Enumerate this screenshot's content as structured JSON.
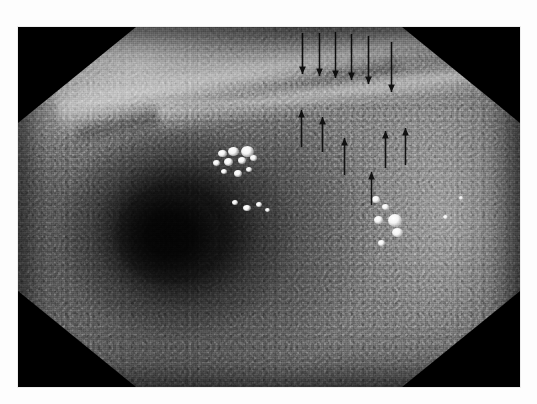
{
  "page": {
    "background_color": "#fdfdfd",
    "width": 537,
    "height": 404
  },
  "figure": {
    "kind": "endoscopic-photograph",
    "modality": "white-light endoscopy",
    "color_mode": "grayscale",
    "frame": {
      "x": 18,
      "y": 27,
      "width": 502,
      "height": 360
    },
    "field_of_view_shape": "octagonal",
    "corner_mask_color": "#000000",
    "caption_visible": false
  },
  "anatomy": {
    "lumen": {
      "center_x": 170,
      "center_y": 235,
      "radius": 50,
      "label": "lumen"
    },
    "fold": {
      "label": "mucosal fold / ridge",
      "orientation": "lower-left to upper-right"
    },
    "bright_rim": {
      "label": "illuminated proximal wall",
      "location": "upper-left"
    }
  },
  "highlights": [
    {
      "name": "mucus-highlight-1",
      "x": 218,
      "y": 150,
      "w": 9,
      "h": 7
    },
    {
      "name": "mucus-highlight-2",
      "x": 228,
      "y": 147,
      "w": 11,
      "h": 9
    },
    {
      "name": "mucus-highlight-3",
      "x": 241,
      "y": 146,
      "w": 13,
      "h": 11
    },
    {
      "name": "mucus-highlight-4",
      "x": 213,
      "y": 160,
      "w": 7,
      "h": 6
    },
    {
      "name": "mucus-highlight-5",
      "x": 224,
      "y": 158,
      "w": 9,
      "h": 8
    },
    {
      "name": "mucus-highlight-6",
      "x": 238,
      "y": 157,
      "w": 8,
      "h": 7
    },
    {
      "name": "mucus-highlight-7",
      "x": 250,
      "y": 155,
      "w": 7,
      "h": 6
    },
    {
      "name": "mucus-highlight-8",
      "x": 221,
      "y": 169,
      "w": 6,
      "h": 5
    },
    {
      "name": "mucus-highlight-9",
      "x": 234,
      "y": 170,
      "w": 8,
      "h": 7
    },
    {
      "name": "mucus-highlight-10",
      "x": 246,
      "y": 167,
      "w": 6,
      "h": 5
    },
    {
      "name": "mucus-highlight-11",
      "x": 232,
      "y": 200,
      "w": 6,
      "h": 5
    },
    {
      "name": "mucus-highlight-12",
      "x": 243,
      "y": 205,
      "w": 8,
      "h": 6
    },
    {
      "name": "mucus-highlight-13",
      "x": 256,
      "y": 202,
      "w": 6,
      "h": 5
    },
    {
      "name": "mucus-highlight-14",
      "x": 265,
      "y": 208,
      "w": 5,
      "h": 4
    },
    {
      "name": "mucus-highlight-15",
      "x": 372,
      "y": 196,
      "w": 8,
      "h": 7
    },
    {
      "name": "mucus-highlight-16",
      "x": 382,
      "y": 204,
      "w": 7,
      "h": 6
    },
    {
      "name": "mucus-highlight-17",
      "x": 374,
      "y": 216,
      "w": 9,
      "h": 8
    },
    {
      "name": "mucus-highlight-18",
      "x": 388,
      "y": 214,
      "w": 14,
      "h": 13
    },
    {
      "name": "mucus-highlight-19",
      "x": 392,
      "y": 228,
      "w": 11,
      "h": 9
    },
    {
      "name": "mucus-highlight-20",
      "x": 378,
      "y": 240,
      "w": 7,
      "h": 6
    },
    {
      "name": "mucus-highlight-21",
      "x": 443,
      "y": 215,
      "w": 5,
      "h": 4
    },
    {
      "name": "mucus-highlight-22",
      "x": 459,
      "y": 196,
      "w": 4,
      "h": 4
    }
  ],
  "annotations": {
    "label": "arrow markers delineating the lesion border",
    "arrow_color": "#111111",
    "count": 12,
    "arrows": [
      {
        "name": "arrow-down-1",
        "direction": "down",
        "x": 302,
        "y_start": 33,
        "y_end": 74
      },
      {
        "name": "arrow-down-2",
        "direction": "down",
        "x": 319,
        "y_start": 33,
        "y_end": 76
      },
      {
        "name": "arrow-down-3",
        "direction": "down",
        "x": 335,
        "y_start": 32,
        "y_end": 78
      },
      {
        "name": "arrow-down-4",
        "direction": "down",
        "x": 351,
        "y_start": 34,
        "y_end": 80
      },
      {
        "name": "arrow-down-5",
        "direction": "down",
        "x": 368,
        "y_start": 36,
        "y_end": 84
      },
      {
        "name": "arrow-down-6",
        "direction": "down",
        "x": 391,
        "y_start": 42,
        "y_end": 92
      },
      {
        "name": "arrow-up-1",
        "direction": "up",
        "x": 301,
        "y_start": 147,
        "y_end": 110
      },
      {
        "name": "arrow-up-2",
        "direction": "up",
        "x": 322,
        "y_start": 152,
        "y_end": 117
      },
      {
        "name": "arrow-up-3",
        "direction": "up",
        "x": 344,
        "y_start": 175,
        "y_end": 138
      },
      {
        "name": "arrow-up-4",
        "direction": "up",
        "x": 371,
        "y_start": 205,
        "y_end": 172
      },
      {
        "name": "arrow-up-5",
        "direction": "up",
        "x": 385,
        "y_start": 168,
        "y_end": 131
      },
      {
        "name": "arrow-up-6",
        "direction": "up",
        "x": 405,
        "y_start": 165,
        "y_end": 128
      }
    ]
  },
  "ghost_text": {
    "top": "",
    "bottom": "·  ·   ·  ·    ·  ·   ·  ·   ·  ·    ·   ·  ·"
  }
}
